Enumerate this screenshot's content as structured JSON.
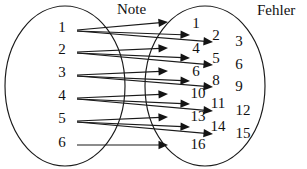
{
  "figure": {
    "width": 307,
    "height": 169,
    "background": "#ffffff",
    "ink_color": "#1a1a1a"
  },
  "chart_data": {
    "type": "diagram",
    "subtype": "mapping-arrow-diagram",
    "title": "",
    "domain_label": "Note",
    "codomain_label": "Fehler",
    "domain_values": [
      1,
      2,
      3,
      4,
      5,
      6
    ],
    "codomain_values": [
      1,
      2,
      3,
      4,
      5,
      6,
      7,
      8,
      9,
      10,
      11,
      12,
      13,
      14,
      15,
      16
    ],
    "codomain_shown": [
      1,
      2,
      3,
      4,
      5,
      6,
      8,
      9,
      10,
      11,
      12,
      13,
      14,
      15,
      16
    ],
    "edges": [
      {
        "from": 1,
        "to": 1
      },
      {
        "from": 1,
        "to": 2
      },
      {
        "from": 1,
        "to": 3
      },
      {
        "from": 2,
        "to": 4
      },
      {
        "from": 2,
        "to": 5
      },
      {
        "from": 2,
        "to": 6
      },
      {
        "from": 3,
        "to": 6
      },
      {
        "from": 3,
        "to": 8
      },
      {
        "from": 3,
        "to": 9
      },
      {
        "from": 4,
        "to": 10
      },
      {
        "from": 4,
        "to": 11
      },
      {
        "from": 4,
        "to": 12
      },
      {
        "from": 5,
        "to": 13
      },
      {
        "from": 5,
        "to": 14
      },
      {
        "from": 5,
        "to": 15
      },
      {
        "from": 6,
        "to": 16
      }
    ],
    "legend_position": "none",
    "grid": false
  },
  "sets": {
    "left": {
      "name": "Note",
      "label": "Note",
      "label_x": 117,
      "label_y": 11,
      "ellipse": {
        "cx": 65,
        "cy": 86,
        "rx": 60,
        "ry": 80
      },
      "nodes": [
        {
          "value": "1",
          "x": 62,
          "y": 29
        },
        {
          "value": "2",
          "x": 62,
          "y": 51
        },
        {
          "value": "3",
          "x": 62,
          "y": 74
        },
        {
          "value": "4",
          "x": 62,
          "y": 97
        },
        {
          "value": "5",
          "x": 62,
          "y": 120
        },
        {
          "value": "6",
          "x": 62,
          "y": 144
        }
      ]
    },
    "right": {
      "name": "Fehler",
      "label": "Fehler",
      "label_x": 257,
      "label_y": 12,
      "ellipse": {
        "cx": 205,
        "cy": 86,
        "rx": 60,
        "ry": 80
      },
      "nodes": [
        {
          "value": "1",
          "x": 196,
          "y": 25
        },
        {
          "value": "2",
          "x": 216,
          "y": 37
        },
        {
          "value": "3",
          "x": 239,
          "y": 43
        },
        {
          "value": "4",
          "x": 196,
          "y": 50
        },
        {
          "value": "5",
          "x": 216,
          "y": 60
        },
        {
          "value": "6",
          "x": 239,
          "y": 66
        },
        {
          "value": "6",
          "x": 196,
          "y": 73
        },
        {
          "value": "8",
          "x": 216,
          "y": 82
        },
        {
          "value": "9",
          "x": 239,
          "y": 88
        },
        {
          "value": "10",
          "x": 198,
          "y": 95
        },
        {
          "value": "11",
          "x": 218,
          "y": 105
        },
        {
          "value": "12",
          "x": 243,
          "y": 112
        },
        {
          "value": "13",
          "x": 198,
          "y": 118
        },
        {
          "value": "14",
          "x": 218,
          "y": 128
        },
        {
          "value": "15",
          "x": 243,
          "y": 135
        },
        {
          "value": "16",
          "x": 198,
          "y": 146
        }
      ]
    }
  },
  "arrows": [
    {
      "name": "edge-1-1",
      "x1": 77,
      "y1": 30,
      "x2": 168,
      "y2": 22
    },
    {
      "name": "edge-1-2",
      "x1": 77,
      "y1": 31,
      "x2": 190,
      "y2": 35
    },
    {
      "name": "edge-1-3",
      "x1": 77,
      "y1": 31,
      "x2": 213,
      "y2": 42
    },
    {
      "name": "edge-2-4",
      "x1": 77,
      "y1": 52,
      "x2": 168,
      "y2": 48
    },
    {
      "name": "edge-2-5",
      "x1": 77,
      "y1": 53,
      "x2": 190,
      "y2": 58
    },
    {
      "name": "edge-2-6",
      "x1": 77,
      "y1": 53,
      "x2": 213,
      "y2": 65
    },
    {
      "name": "edge-3-6",
      "x1": 77,
      "y1": 75,
      "x2": 168,
      "y2": 71
    },
    {
      "name": "edge-3-8",
      "x1": 77,
      "y1": 76,
      "x2": 190,
      "y2": 81
    },
    {
      "name": "edge-3-9",
      "x1": 77,
      "y1": 76,
      "x2": 213,
      "y2": 87
    },
    {
      "name": "edge-4-10",
      "x1": 77,
      "y1": 98,
      "x2": 168,
      "y2": 94
    },
    {
      "name": "edge-4-11",
      "x1": 77,
      "y1": 99,
      "x2": 190,
      "y2": 104
    },
    {
      "name": "edge-4-12",
      "x1": 77,
      "y1": 99,
      "x2": 213,
      "y2": 111
    },
    {
      "name": "edge-5-13",
      "x1": 77,
      "y1": 121,
      "x2": 168,
      "y2": 117
    },
    {
      "name": "edge-5-14",
      "x1": 77,
      "y1": 122,
      "x2": 190,
      "y2": 127
    },
    {
      "name": "edge-5-15",
      "x1": 77,
      "y1": 122,
      "x2": 213,
      "y2": 134
    },
    {
      "name": "edge-6-16",
      "x1": 77,
      "y1": 145,
      "x2": 168,
      "y2": 145
    }
  ]
}
